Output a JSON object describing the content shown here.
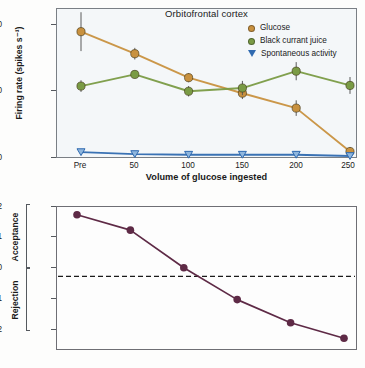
{
  "figure": {
    "panel_a": {
      "title": "Orbitofrontal cortex",
      "ylabel": "Firing rate (spikes s⁻¹)",
      "xlabel": "Volume of glucose ingested",
      "yticks": [
        "0",
        "10",
        "20"
      ],
      "xticks": [
        "Pre",
        "50",
        "100",
        "150",
        "200",
        "250"
      ],
      "legend": [
        {
          "label": "Glucose",
          "marker": "circle-marker",
          "color": "#c8913f"
        },
        {
          "label": "Black currant juice",
          "marker": "circle-marker",
          "color": "#7a9b45"
        },
        {
          "label": "Spontaneous activity",
          "marker": "triangle-down-marker",
          "color": "#2f6ab0"
        }
      ]
    },
    "panel_b": {
      "yticks": [
        "+2",
        "+1",
        "0",
        "-1",
        "-2"
      ],
      "bracket_upper_label": "Acceptance",
      "bracket_lower_label": "Rejection",
      "line_color": "#5e2a46",
      "zero_line_style": "dashed"
    }
  },
  "chart_data": [
    {
      "type": "line",
      "title": "Orbitofrontal cortex",
      "xlabel": "Volume of glucose ingested",
      "ylabel": "Firing rate (spikes s⁻¹)",
      "categories": [
        "Pre",
        "50",
        "100",
        "150",
        "200",
        "250"
      ],
      "ylim": [
        0,
        23
      ],
      "yticks": [
        0,
        10,
        20
      ],
      "grid": false,
      "legend_position": "top-right",
      "series": [
        {
          "name": "Glucose",
          "color": "#c8913f",
          "values": [
            19.5,
            16.1,
            12.4,
            10.0,
            7.7,
            1.0
          ],
          "errors": [
            3.0,
            0.9,
            0.7,
            0.9,
            1.2,
            0.7
          ]
        },
        {
          "name": "Black currant juice",
          "color": "#7a9b45",
          "values": [
            11.1,
            12.9,
            10.3,
            10.8,
            13.4,
            11.2
          ],
          "errors": [
            0.9,
            0.6,
            0.8,
            1.1,
            1.4,
            1.3
          ]
        },
        {
          "name": "Spontaneous activity",
          "color": "#2f6ab0",
          "values": [
            0.9,
            0.6,
            0.5,
            0.5,
            0.5,
            0.3
          ],
          "errors": [
            0.3,
            0.2,
            0.2,
            0.2,
            0.2,
            0.2
          ]
        }
      ]
    },
    {
      "type": "line",
      "title": "",
      "xlabel": "",
      "ylabel": "Acceptance / Rejection",
      "categories": [
        "Pre",
        "50",
        "100",
        "150",
        "200",
        "250"
      ],
      "ylim": [
        -2.35,
        2.25
      ],
      "yticks": [
        2,
        1,
        0,
        -1,
        -2
      ],
      "grid": false,
      "annotations": [
        "zero reference dashed line at 0"
      ],
      "series": [
        {
          "name": "Acceptance rating",
          "color": "#5e2a46",
          "values": [
            2.0,
            1.5,
            0.28,
            -0.75,
            -1.5,
            -2.0
          ]
        }
      ]
    }
  ]
}
